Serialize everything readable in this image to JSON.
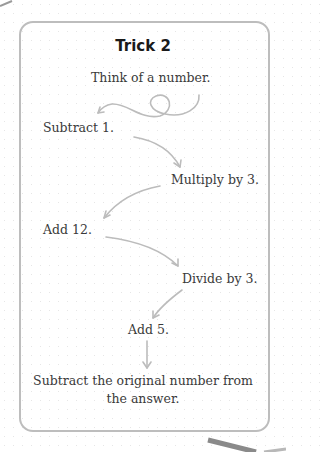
{
  "card": {
    "title": "Trick 2",
    "steps": [
      "Think of a number.",
      "Subtract 1.",
      "Multiply by 3.",
      "Add 12.",
      "Divide by 3.",
      "Add 5.",
      "Subtract the original number from",
      "the answer."
    ]
  },
  "colors": {
    "border": "#bdbdbd",
    "arrow": "#bcbcbc",
    "text": "#3a3a3a",
    "corner_arrow": "#8a8a8a"
  }
}
